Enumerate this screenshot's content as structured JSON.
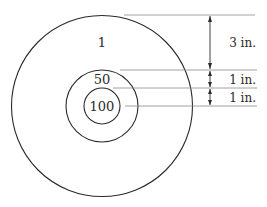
{
  "diagram": {
    "type": "concentric-circles-target",
    "zones": [
      {
        "id": "outer",
        "points_label": "1"
      },
      {
        "id": "middle",
        "points_label": "50"
      },
      {
        "id": "inner",
        "points_label": "100"
      }
    ],
    "dimensions": [
      {
        "id": "outer-band",
        "label": "3 in.",
        "value_in": 3
      },
      {
        "id": "middle-band",
        "label": "1 in.",
        "value_in": 1
      },
      {
        "id": "inner-radius",
        "label": "1 in.",
        "value_in": 1
      }
    ],
    "colors": {
      "stroke": "#2a2a2a",
      "guide": "#8a8a8a",
      "background": "#ffffff"
    }
  }
}
